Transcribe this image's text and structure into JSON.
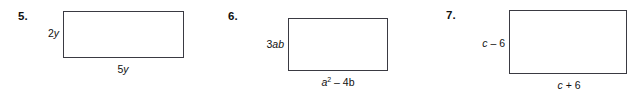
{
  "worksheet": {
    "background_color": "#ffffff",
    "stroke_color": "#3a3a42",
    "text_color": "#111111",
    "problems": [
      {
        "number": "5.",
        "side_label": "2y",
        "side_label_coefficient": "2",
        "side_label_variable": "y",
        "bottom_label": "5y",
        "bottom_label_coefficient": "5",
        "bottom_label_variable": "y"
      },
      {
        "number": "6.",
        "side_label": "3ab",
        "side_label_coefficient": "3",
        "side_label_variable": "ab",
        "bottom_label": "a2 – 4b",
        "bottom_base": "a",
        "bottom_exponent": "2",
        "bottom_operator": " – 4",
        "bottom_tail": "b"
      },
      {
        "number": "7.",
        "side_label": "c – 6",
        "side_label_variable": "c",
        "side_label_rest": " – 6",
        "bottom_label": "c + 6",
        "bottom_label_variable": "c",
        "bottom_label_rest": " + 6"
      }
    ]
  }
}
